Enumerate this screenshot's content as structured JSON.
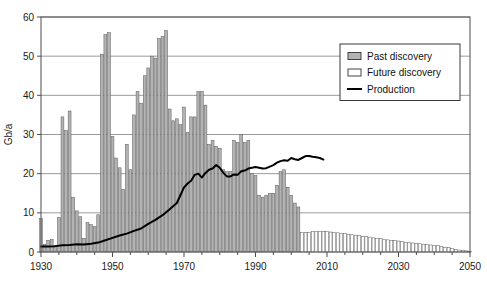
{
  "chart_data": {
    "type": "bar",
    "title": "",
    "subtitle": "",
    "xlabel": "",
    "ylabel": "Gb/a",
    "xlim": [
      1930,
      2050
    ],
    "ylim": [
      0,
      60
    ],
    "ytick_labels": [
      "0",
      "10",
      "20",
      "30",
      "40",
      "50",
      "60"
    ],
    "yticks": [
      0,
      10,
      20,
      30,
      40,
      50,
      60
    ],
    "xtick_labels": [
      "1930",
      "1950",
      "1970",
      "1990",
      "2010",
      "2030",
      "2050"
    ],
    "xticks": [
      1930,
      1950,
      1970,
      1990,
      2010,
      2030,
      2050
    ],
    "xtick_minor_step": 5,
    "grid": "horizontal",
    "legend_position": "upper-right",
    "legend": [
      {
        "label": "Past discovery",
        "kind": "bar",
        "color": "#b3b3b3"
      },
      {
        "label": "Future discovery",
        "kind": "bar",
        "color": "#ffffff"
      },
      {
        "label": "Production",
        "kind": "line",
        "color": "#000000"
      }
    ],
    "series": [
      {
        "name": "Past discovery",
        "kind": "bar",
        "color": "#b3b3b3",
        "x": [
          1930,
          1931,
          1932,
          1933,
          1934,
          1935,
          1936,
          1937,
          1938,
          1939,
          1940,
          1941,
          1942,
          1943,
          1944,
          1945,
          1946,
          1947,
          1948,
          1949,
          1950,
          1951,
          1952,
          1953,
          1954,
          1955,
          1956,
          1957,
          1958,
          1959,
          1960,
          1961,
          1962,
          1963,
          1964,
          1965,
          1966,
          1967,
          1968,
          1969,
          1970,
          1971,
          1972,
          1973,
          1974,
          1975,
          1976,
          1977,
          1978,
          1979,
          1980,
          1981,
          1982,
          1983,
          1984,
          1985,
          1986,
          1987,
          1988,
          1989,
          1990,
          1991,
          1992,
          1993,
          1994,
          1995,
          1996,
          1997,
          1998,
          1999,
          2000,
          2001,
          2002
        ],
        "values": [
          8.5,
          2.0,
          3.0,
          3.2,
          1.6,
          8.8,
          34.5,
          31.0,
          36.0,
          14.0,
          10.5,
          9.0,
          3.5,
          7.5,
          7.0,
          6.5,
          9.5,
          50.5,
          55.5,
          56.0,
          29.5,
          24.0,
          21.5,
          16.0,
          27.5,
          21.0,
          35.0,
          41.0,
          38.0,
          45.0,
          47.0,
          50.0,
          49.5,
          54.5,
          55.0,
          56.5,
          36.5,
          33.5,
          34.0,
          32.5,
          37.0,
          30.5,
          34.5,
          34.5,
          41.0,
          41.0,
          37.5,
          27.5,
          28.5,
          27.0,
          26.5,
          21.0,
          20.5,
          20.5,
          28.5,
          28.0,
          30.0,
          28.0,
          28.5,
          20.0,
          19.5,
          14.5,
          14.0,
          14.5,
          15.0,
          15.0,
          17.0,
          20.5,
          21.0,
          16.5,
          14.5,
          12.5,
          11.5
        ]
      },
      {
        "name": "Future discovery",
        "kind": "bar",
        "color": "#ffffff",
        "x": [
          2003,
          2004,
          2005,
          2006,
          2007,
          2008,
          2009,
          2010,
          2011,
          2012,
          2013,
          2014,
          2015,
          2016,
          2017,
          2018,
          2019,
          2020,
          2021,
          2022,
          2023,
          2024,
          2025,
          2026,
          2027,
          2028,
          2029,
          2030,
          2031,
          2032,
          2033,
          2034,
          2035,
          2036,
          2037,
          2038,
          2039,
          2040,
          2041,
          2042,
          2043,
          2044,
          2045,
          2046,
          2047,
          2048,
          2049,
          2050
        ],
        "values": [
          5.0,
          5.0,
          5.0,
          5.2,
          5.3,
          5.3,
          5.3,
          5.2,
          5.1,
          5.0,
          4.9,
          4.8,
          4.7,
          4.5,
          4.4,
          4.3,
          4.2,
          4.0,
          3.9,
          3.8,
          3.6,
          3.5,
          3.4,
          3.2,
          3.1,
          3.0,
          2.9,
          2.8,
          2.7,
          2.5,
          2.4,
          2.3,
          2.2,
          2.1,
          2.0,
          1.9,
          1.8,
          1.7,
          1.6,
          1.4,
          1.2,
          1.1,
          0.9,
          0.7,
          0.5,
          0.4,
          0.3,
          0.2
        ]
      },
      {
        "name": "Production",
        "kind": "line",
        "color": "#000000",
        "x": [
          1930,
          1932,
          1934,
          1936,
          1938,
          1940,
          1942,
          1944,
          1946,
          1948,
          1950,
          1952,
          1954,
          1956,
          1958,
          1960,
          1962,
          1964,
          1966,
          1968,
          1970,
          1971,
          1972,
          1973,
          1974,
          1975,
          1976,
          1977,
          1978,
          1979,
          1980,
          1981,
          1982,
          1983,
          1984,
          1985,
          1986,
          1987,
          1988,
          1989,
          1990,
          1991,
          1992,
          1993,
          1994,
          1995,
          1996,
          1997,
          1998,
          1999,
          2000,
          2001,
          2002,
          2003,
          2004,
          2005,
          2006,
          2007,
          2008,
          2009
        ],
        "values": [
          1.4,
          1.4,
          1.5,
          1.7,
          1.8,
          2.0,
          1.9,
          2.1,
          2.4,
          3.0,
          3.6,
          4.2,
          4.7,
          5.4,
          6.0,
          7.2,
          8.2,
          9.4,
          10.9,
          12.5,
          16.5,
          17.5,
          18.2,
          19.7,
          20.0,
          19.0,
          20.2,
          21.0,
          21.3,
          22.2,
          21.5,
          20.2,
          19.3,
          19.3,
          19.8,
          19.7,
          20.6,
          20.8,
          21.3,
          21.5,
          21.7,
          21.5,
          21.3,
          21.4,
          21.8,
          22.2,
          22.8,
          23.2,
          23.4,
          23.3,
          24.0,
          23.7,
          23.5,
          24.0,
          24.5,
          24.5,
          24.3,
          24.2,
          24.0,
          23.6
        ]
      }
    ]
  }
}
